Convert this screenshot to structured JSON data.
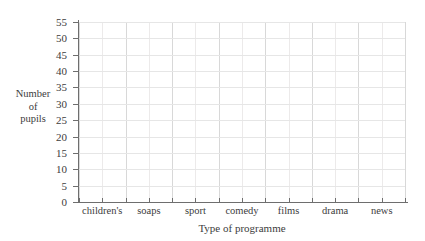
{
  "chart_data": {
    "type": "bar",
    "title": "",
    "subtitle": "",
    "xlabel": "Type of programme",
    "ylabel": "Number of pupils",
    "ylabel_lines": [
      "Number",
      "of",
      "pupils"
    ],
    "categories": [
      "children's",
      "soaps",
      "sport",
      "comedy",
      "films",
      "drama",
      "news"
    ],
    "values": [
      null,
      null,
      null,
      null,
      null,
      null,
      null
    ],
    "series": [
      {
        "name": "",
        "values": [
          null,
          null,
          null,
          null,
          null,
          null,
          null
        ]
      }
    ],
    "ylim": [
      0,
      55
    ],
    "ytick_step": 5,
    "yticks": [
      0,
      5,
      10,
      15,
      20,
      25,
      30,
      35,
      40,
      45,
      50,
      55
    ],
    "ytick_labels": [
      "0",
      "5",
      "10",
      "15",
      "20",
      "25",
      "30",
      "35",
      "40",
      "45",
      "50",
      "55"
    ],
    "grid": true,
    "grid_columns": 14,
    "columns_per_category": 2,
    "legend": false,
    "legend_position": "none",
    "annotations": [],
    "note": "Blank grid: axes and gridlines drawn, no bars plotted"
  },
  "axis": {
    "y_title_lines": [
      "Number",
      "of",
      "pupils"
    ],
    "x_title": "Type of programme"
  },
  "colors": {
    "background": "#ffffff",
    "axis_line": "#6e6e6e",
    "grid_major": "#d8d8d8",
    "grid_minor": "#eceaea",
    "grid_horizontal": "#e6e6e6",
    "text": "#3c3c3c"
  }
}
